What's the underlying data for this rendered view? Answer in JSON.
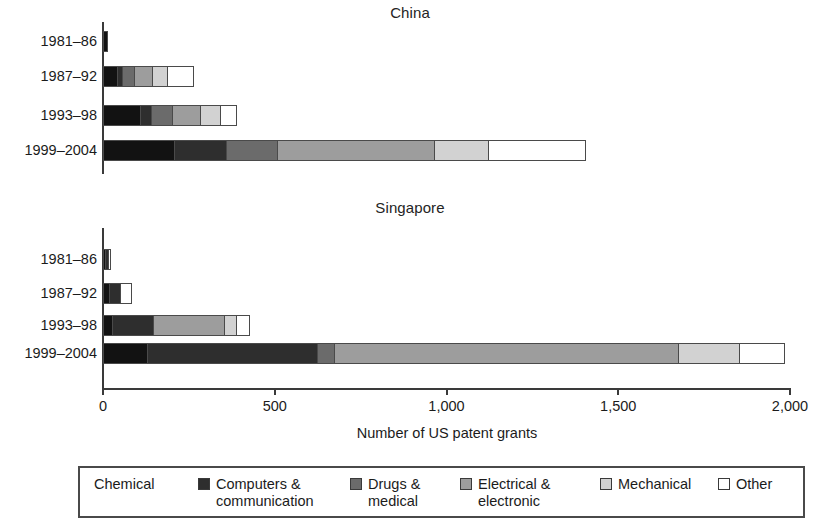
{
  "axis": {
    "xlabel": "Number of US patent grants",
    "ticks": [
      "0",
      "500",
      "1,000",
      "1,500",
      "2,000"
    ]
  },
  "panels": [
    {
      "title": "China"
    },
    {
      "title": "Singapore"
    }
  ],
  "categories": [
    "1981–86",
    "1987–92",
    "1993–98",
    "1999–2004"
  ],
  "legend": [
    {
      "label": "Chemical",
      "key": "chemical",
      "color": "#121212"
    },
    {
      "label": "Computers &\ncommunication",
      "key": "computers",
      "color": "#2e2e2e"
    },
    {
      "label": "Drugs &\nmedical",
      "key": "drugs",
      "color": "#6b6b6b"
    },
    {
      "label": "Electrical &\nelectronic",
      "key": "electrical",
      "color": "#9d9d9d"
    },
    {
      "label": "Mechanical",
      "key": "mechanical",
      "color": "#d2d2d2"
    },
    {
      "label": "Other",
      "key": "other",
      "color": "#ffffff"
    }
  ],
  "chart_data": {
    "type": "bar",
    "orientation": "horizontal",
    "stacked": true,
    "title": "",
    "xlabel": "Number of US patent grants",
    "ylabel": "",
    "xlim": [
      0,
      2000
    ],
    "xticks": [
      0,
      500,
      1000,
      1500,
      2000
    ],
    "grid": false,
    "legend_position": "bottom",
    "categories": [
      "1981–86",
      "1987–92",
      "1993–98",
      "1999–2004"
    ],
    "series_names": [
      "Chemical",
      "Computers & communication",
      "Drugs & medical",
      "Electrical & electronic",
      "Mechanical",
      "Other"
    ],
    "panels": [
      {
        "name": "China",
        "series": [
          {
            "name": "Chemical",
            "values": [
              15,
              45,
              110,
              210
            ]
          },
          {
            "name": "Computers & communication",
            "values": [
              0,
              15,
              35,
              155
            ]
          },
          {
            "name": "Drugs & medical",
            "values": [
              0,
              40,
              65,
              150
            ]
          },
          {
            "name": "Electrical & electronic",
            "values": [
              0,
              55,
              85,
              460
            ]
          },
          {
            "name": "Mechanical",
            "values": [
              0,
              45,
              60,
              160
            ]
          },
          {
            "name": "Other",
            "values": [
              0,
              80,
              50,
              285
            ]
          }
        ],
        "totals": [
          15,
          280,
          405,
          1420
        ]
      },
      {
        "name": "Singapore",
        "series": [
          {
            "name": "Chemical",
            "values": [
              10,
              20,
              30,
              130
            ]
          },
          {
            "name": "Computers & communication",
            "values": [
              10,
              35,
              120,
              500
            ]
          },
          {
            "name": "Drugs & medical",
            "values": [
              0,
              0,
              0,
              50
            ]
          },
          {
            "name": "Electrical & electronic",
            "values": [
              0,
              0,
              210,
              1005
            ]
          },
          {
            "name": "Mechanical",
            "values": [
              0,
              0,
              40,
              180
            ]
          },
          {
            "name": "Other",
            "values": [
              10,
              35,
              40,
              135
            ]
          }
        ],
        "totals": [
          30,
          90,
          440,
          2000
        ]
      }
    ]
  }
}
